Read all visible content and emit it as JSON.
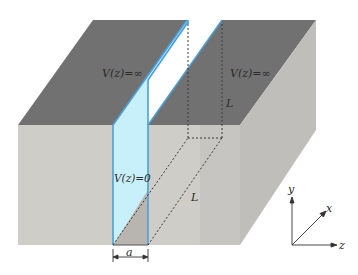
{
  "figure": {
    "type": "diagram"
  },
  "colors": {
    "top_surface": "#707070",
    "front_face": "#cdcbc6",
    "right_face": "#bdbcb8",
    "channel_fill": "#c8f0fa",
    "channel_edge": "#4aa0dc",
    "channel_floor": "#b9b6b1",
    "dashed_line": "#3a3a3a",
    "text": "#2a2a2a"
  },
  "labels": {
    "top_left_potential": "V(z)=∞",
    "top_right_potential": "V(z)=∞",
    "channel_potential": "V(z)=0",
    "length_vertical": "L",
    "length_depth": "L",
    "width": "a"
  },
  "axes": {
    "y": "y",
    "x": "x",
    "z": "z"
  }
}
